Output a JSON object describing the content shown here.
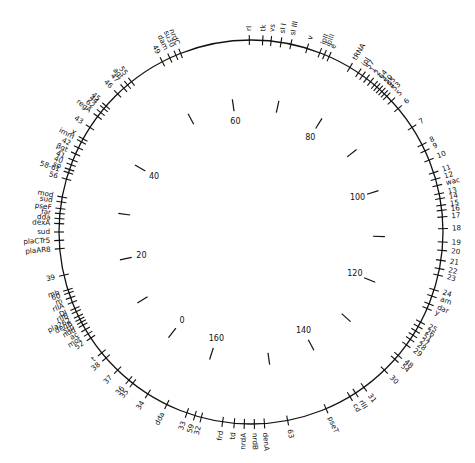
{
  "map": {
    "title": "",
    "center": [
      251,
      232
    ],
    "radius": 192,
    "line_color": "#111111",
    "background": "#ffffff",
    "inner_scale": {
      "unit": "kb",
      "ticks": [
        {
          "angle": -28,
          "label": ""
        },
        {
          "angle": -8,
          "label": "60"
        },
        {
          "angle": 12,
          "label": ""
        },
        {
          "angle": 32,
          "label": "80"
        },
        {
          "angle": 52,
          "label": ""
        },
        {
          "angle": 72,
          "label": "100"
        },
        {
          "angle": 92,
          "label": ""
        },
        {
          "angle": 112,
          "label": "120"
        },
        {
          "angle": 132,
          "label": ""
        },
        {
          "angle": 152,
          "label": "140"
        },
        {
          "angle": 172,
          "label": ""
        },
        {
          "angle": 198,
          "label": "160"
        },
        {
          "angle": 218,
          "label": "0"
        },
        {
          "angle": 238,
          "label": ""
        },
        {
          "angle": 258,
          "label": "20"
        },
        {
          "angle": 278,
          "label": ""
        },
        {
          "angle": 300,
          "label": "40"
        }
      ]
    },
    "genes": [
      {
        "label": "rI",
        "angle": -0.5
      },
      {
        "label": "tk",
        "angle": 3.5
      },
      {
        "label": "vs",
        "angle": 6
      },
      {
        "label": "sI I",
        "angle": 9
      },
      {
        "label": "sI III",
        "angle": 12
      },
      {
        "label": "v",
        "angle": 17
      },
      {
        "label": "ipII",
        "angle": 21
      },
      {
        "label": "ipIII",
        "angle": 22.5
      },
      {
        "label": "e",
        "angle": 24
      },
      {
        "label": "tRNA",
        "angle": 31
      },
      {
        "label": "ipI",
        "angle": 34
      },
      {
        "label": "57",
        "angle": 35.5
      },
      {
        "label": "1",
        "angle": 37
      },
      {
        "label": "2",
        "angle": 38.5
      },
      {
        "label": "64",
        "angle": 40
      },
      {
        "label": "3",
        "angle": 41
      },
      {
        "label": "50",
        "angle": 42
      },
      {
        "label": "65",
        "angle": 43
      },
      {
        "label": "4",
        "angle": 44
      },
      {
        "label": "53",
        "angle": 45
      },
      {
        "label": "5",
        "angle": 47
      },
      {
        "label": "6",
        "angle": 50
      },
      {
        "label": "7",
        "angle": 57
      },
      {
        "label": "8",
        "angle": 63
      },
      {
        "label": "9",
        "angle": 65
      },
      {
        "label": "10",
        "angle": 68
      },
      {
        "label": "11",
        "angle": 72
      },
      {
        "label": "12",
        "angle": 74
      },
      {
        "label": "wac",
        "angle": 76
      },
      {
        "label": "13",
        "angle": 78.5
      },
      {
        "label": "14",
        "angle": 80
      },
      {
        "label": "15",
        "angle": 82
      },
      {
        "label": "16",
        "angle": 83.5
      },
      {
        "label": "17",
        "angle": 85.5
      },
      {
        "label": "18",
        "angle": 89
      },
      {
        "label": "19",
        "angle": 93
      },
      {
        "label": "20",
        "angle": 95.5
      },
      {
        "label": "21",
        "angle": 98.5
      },
      {
        "label": "22",
        "angle": 101
      },
      {
        "label": "23",
        "angle": 103
      },
      {
        "label": "24",
        "angle": 107.5
      },
      {
        "label": "am",
        "angle": 109.5
      },
      {
        "label": "dar",
        "angle": 112
      },
      {
        "label": "y",
        "angle": 113.5
      },
      {
        "label": "25",
        "angle": 118
      },
      {
        "label": "26",
        "angle": 119.5
      },
      {
        "label": "51",
        "angle": 121
      },
      {
        "label": "27",
        "angle": 122.5
      },
      {
        "label": "28",
        "angle": 124
      },
      {
        "label": "29",
        "angle": 126
      },
      {
        "label": "48",
        "angle": 130
      },
      {
        "label": "54",
        "angle": 131.5
      },
      {
        "label": "30",
        "angle": 136
      },
      {
        "label": "31",
        "angle": 144
      },
      {
        "label": "rIII",
        "angle": 147
      },
      {
        "label": "cd",
        "angle": 149
      },
      {
        "label": "pseT",
        "angle": 157
      },
      {
        "label": "63",
        "angle": 169
      },
      {
        "label": "denA",
        "angle": 176
      },
      {
        "label": "nrdB",
        "angle": 179
      },
      {
        "label": "nrdA",
        "angle": 182
      },
      {
        "label": "td",
        "angle": 185
      },
      {
        "label": "frd",
        "angle": 188.5
      },
      {
        "label": "32",
        "angle": 195
      },
      {
        "label": "59",
        "angle": 197
      },
      {
        "label": "33",
        "angle": 199.5
      },
      {
        "label": "dda",
        "angle": 206
      },
      {
        "label": "34",
        "angle": 212.5
      },
      {
        "label": "35",
        "angle": 218
      },
      {
        "label": "36",
        "angle": 219.5
      },
      {
        "label": "37",
        "angle": 224
      },
      {
        "label": "38",
        "angle": 229
      },
      {
        "label": "t",
        "angle": 231
      },
      {
        "label": "52",
        "angle": 236.5
      },
      {
        "label": "mot",
        "angle": 238
      },
      {
        "label": "ac",
        "angle": 239.5
      },
      {
        "label": "ndd",
        "angle": 241
      },
      {
        "label": "stp",
        "angle": 242
      },
      {
        "label": "denB",
        "angle": 243
      },
      {
        "label": "pla262",
        "angle": 244
      },
      {
        "label": "rIIB",
        "angle": 245.5
      },
      {
        "label": "DI",
        "angle": 246.5
      },
      {
        "label": "rIIA",
        "angle": 248.5
      },
      {
        "label": "m",
        "angle": 250
      },
      {
        "label": "60",
        "angle": 251.5
      },
      {
        "label": "mb",
        "angle": 252.5
      },
      {
        "label": "39",
        "angle": 257
      },
      {
        "label": "plaAR8",
        "angle": 265
      },
      {
        "label": "plaCTr5",
        "angle": 267.5
      },
      {
        "label": "sud",
        "angle": 270
      },
      {
        "label": "dexA",
        "angle": 272.5
      },
      {
        "label": "dda",
        "angle": 274
      },
      {
        "label": "far",
        "angle": 275.5
      },
      {
        "label": "pseF",
        "angle": 277
      },
      {
        "label": "sud",
        "angle": 279
      },
      {
        "label": "mod",
        "angle": 280.5
      },
      {
        "label": "56",
        "angle": 286
      },
      {
        "label": "58-61",
        "angle": 288
      },
      {
        "label": "sp",
        "angle": 289
      },
      {
        "label": "40",
        "angle": 290.5
      },
      {
        "label": "41",
        "angle": 292
      },
      {
        "label": "βgt",
        "angle": 294
      },
      {
        "label": "42",
        "angle": 296
      },
      {
        "label": "imm",
        "angle": 298
      },
      {
        "label": "X",
        "angle": 299
      },
      {
        "label": "43",
        "angle": 303
      },
      {
        "label": "regA",
        "angle": 307
      },
      {
        "label": "62",
        "angle": 308.5
      },
      {
        "label": "44",
        "angle": 310
      },
      {
        "label": "45",
        "angle": 311
      },
      {
        "label": "46",
        "angle": 316
      },
      {
        "label": "47",
        "angle": 318.5
      },
      {
        "label": "agt",
        "angle": 320
      },
      {
        "label": "55",
        "angle": 321.5
      },
      {
        "label": "49",
        "angle": 332.5
      },
      {
        "label": "dam",
        "angle": 335
      },
      {
        "label": "su30",
        "angle": 337
      },
      {
        "label": "nrdC",
        "angle": 338.5
      }
    ]
  }
}
